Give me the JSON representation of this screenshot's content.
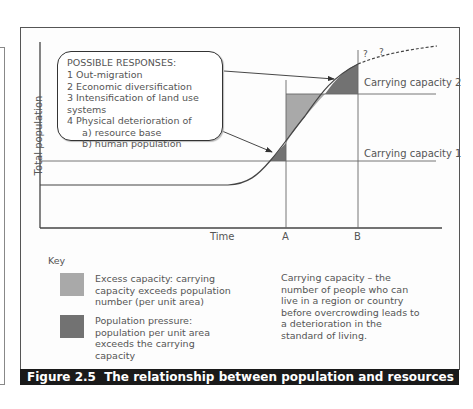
{
  "figure": {
    "number": "Figure 2.5",
    "caption": "The relationship between population and resources"
  },
  "axes": {
    "y_label": "Total population",
    "x_label": "Time",
    "markers": [
      "A",
      "B"
    ]
  },
  "lines": {
    "cc1": "Carrying capacity 1",
    "cc2": "Carrying capacity 2",
    "uncertain": [
      "?",
      "?"
    ]
  },
  "callout": {
    "title": "POSSIBLE RESPONSES:",
    "items": [
      "1  Out-migration",
      "2  Economic diversification",
      "3  Intensification of land use systems",
      "4  Physical deterioration of",
      "     a) resource base",
      "     b) human population"
    ]
  },
  "key": {
    "title": "Key",
    "items": [
      {
        "color": "#a9a9a9",
        "label": "Excess capacity: carrying capacity exceeds population number (per unit area)"
      },
      {
        "color": "#727272",
        "label": "Population pressure: population per unit area exceeds the carrying capacity"
      }
    ]
  },
  "definition": "Carrying capacity – the number of people who can live in a region or country before overcrowding leads to a deterioration in the standard of living.",
  "colors": {
    "excess": "#a9a9a9",
    "pressure": "#727272",
    "caption_bg": "#1a1a1a"
  }
}
